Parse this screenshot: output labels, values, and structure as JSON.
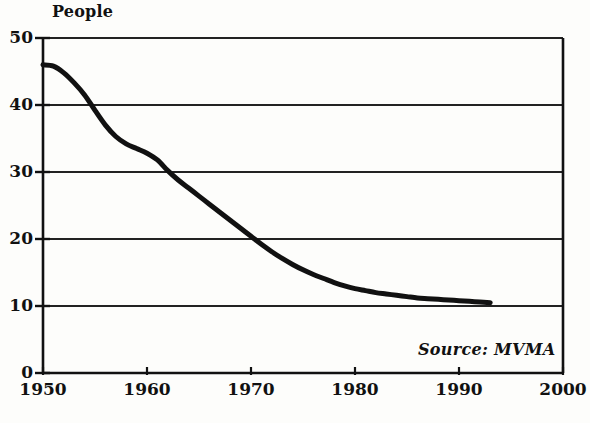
{
  "chart_data": {
    "type": "line",
    "title": "People",
    "ylabel": "People",
    "xlabel": "",
    "annotation": "Source: MVMA",
    "grid": true,
    "legend": "none",
    "xlim": [
      1950,
      2000
    ],
    "ylim": [
      0,
      50
    ],
    "x_ticks": [
      1950,
      1960,
      1970,
      1980,
      1990,
      2000
    ],
    "x_tick_labels": [
      "1950",
      "1960",
      "1970",
      "1980",
      "1990",
      "2000"
    ],
    "y_ticks": [
      0,
      10,
      20,
      30,
      40,
      50
    ],
    "y_tick_labels": [
      "0",
      "10",
      "20",
      "30",
      "40",
      "50"
    ],
    "series": [
      {
        "name": "People per vehicle",
        "x": [
          1950,
          1951,
          1952,
          1953,
          1954,
          1955,
          1956,
          1957,
          1958,
          1959,
          1960,
          1961,
          1962,
          1963,
          1964,
          1965,
          1966,
          1967,
          1968,
          1969,
          1970,
          1971,
          1972,
          1973,
          1974,
          1975,
          1976,
          1977,
          1978,
          1979,
          1980,
          1981,
          1982,
          1983,
          1984,
          1985,
          1986,
          1987,
          1988,
          1989,
          1990,
          1991,
          1992,
          1993
        ],
        "values": [
          46.0,
          45.8,
          44.8,
          43.3,
          41.5,
          39.2,
          37.0,
          35.3,
          34.2,
          33.5,
          32.8,
          31.8,
          30.2,
          28.8,
          27.6,
          26.4,
          25.2,
          24.0,
          22.8,
          21.6,
          20.4,
          19.2,
          18.1,
          17.1,
          16.2,
          15.4,
          14.7,
          14.1,
          13.5,
          13.0,
          12.6,
          12.3,
          12.0,
          11.8,
          11.6,
          11.4,
          11.2,
          11.1,
          11.0,
          10.9,
          10.8,
          10.7,
          10.6,
          10.5
        ]
      }
    ]
  },
  "style": {
    "line_color": "#111111",
    "grid_color": "#222222",
    "axis_color": "#111111",
    "background": "#fdfdfb"
  }
}
